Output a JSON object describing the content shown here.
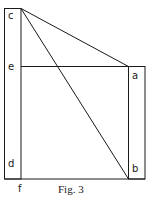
{
  "figure": {
    "caption": "Fig. 3",
    "labels": {
      "c": "c",
      "e": "e",
      "d": "d",
      "f": "f",
      "a": "a",
      "b": "b"
    },
    "points": {
      "c": [
        21,
        8
      ],
      "e": [
        21,
        66
      ],
      "a": [
        128,
        66
      ],
      "b": [
        128,
        179
      ],
      "f": [
        21,
        179
      ]
    },
    "colors": {
      "stroke": "#1a1a1a",
      "background": "#ffffff"
    }
  }
}
